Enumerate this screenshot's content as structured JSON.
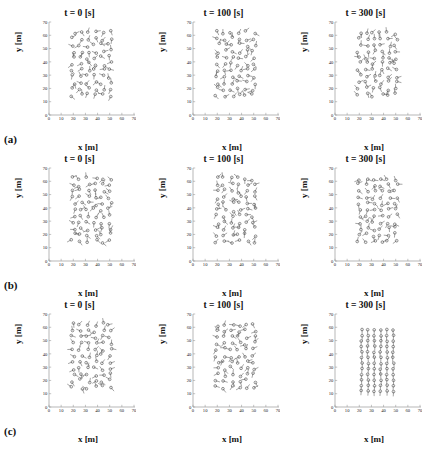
{
  "figure": {
    "type": "multi-panel-scatter-quiver",
    "rows": 3,
    "cols": 3,
    "background": "#ffffff",
    "marker_color": "#555555",
    "axis_color": "#888888"
  },
  "axis": {
    "xlabel": "x [m]",
    "ylabel": "y [m]",
    "xticks": [
      0,
      10,
      20,
      30,
      40,
      50,
      60,
      70
    ],
    "yticks": [
      0,
      10,
      20,
      30,
      40,
      50,
      60,
      70
    ],
    "xlim": [
      0,
      70
    ],
    "ylim": [
      0,
      70
    ],
    "grid": false
  },
  "row_labels": [
    "(a)",
    "(b)",
    "(c)"
  ],
  "column_titles": [
    "t = 0 [s]",
    "t = 100 [s]",
    "t = 300 [s]"
  ],
  "chart_data": {
    "type": "scatter",
    "title": "",
    "xlabel": "x [m]",
    "ylabel": "y [m]",
    "xlim": [
      0,
      70
    ],
    "ylim": [
      0,
      70
    ],
    "xticks": [
      0,
      10,
      20,
      30,
      40,
      50,
      60,
      70
    ],
    "yticks": [
      0,
      10,
      20,
      30,
      40,
      50,
      60,
      70
    ],
    "grid": false,
    "legend": "none",
    "marker": "open-circle-with-velocity-tail",
    "panels": [
      {
        "row": "(a)",
        "title": "t = 0 [s]",
        "n_points": 66,
        "cluster_x_range": [
          20,
          50
        ],
        "cluster_y_range": [
          15,
          62
        ],
        "order": "lattice-disordered-headings",
        "seed": 11
      },
      {
        "row": "(a)",
        "title": "t = 100 [s]",
        "n_points": 66,
        "cluster_x_range": [
          20,
          50
        ],
        "cluster_y_range": [
          15,
          62
        ],
        "order": "lattice-disordered-headings",
        "seed": 23
      },
      {
        "row": "(a)",
        "title": "t = 300 [s]",
        "n_points": 66,
        "cluster_x_range": [
          20,
          50
        ],
        "cluster_y_range": [
          15,
          62
        ],
        "order": "lattice-disordered-headings",
        "seed": 37
      },
      {
        "row": "(b)",
        "title": "t = 0 [s]",
        "n_points": 66,
        "cluster_x_range": [
          20,
          50
        ],
        "cluster_y_range": [
          15,
          62
        ],
        "order": "lattice-disordered-headings",
        "seed": 53
      },
      {
        "row": "(b)",
        "title": "t = 100 [s]",
        "n_points": 66,
        "cluster_x_range": [
          20,
          50
        ],
        "cluster_y_range": [
          15,
          62
        ],
        "order": "lattice-disordered-headings",
        "seed": 71
      },
      {
        "row": "(b)",
        "title": "t = 300 [s]",
        "n_points": 66,
        "cluster_x_range": [
          20,
          50
        ],
        "cluster_y_range": [
          15,
          62
        ],
        "order": "lattice-disordered-headings",
        "seed": 89
      },
      {
        "row": "(c)",
        "title": "t = 0 [s]",
        "n_points": 66,
        "cluster_x_range": [
          20,
          50
        ],
        "cluster_y_range": [
          15,
          62
        ],
        "order": "lattice-disordered-headings",
        "seed": 101
      },
      {
        "row": "(c)",
        "title": "t = 100 [s]",
        "n_points": 66,
        "cluster_x_range": [
          20,
          50
        ],
        "cluster_y_range": [
          15,
          62
        ],
        "order": "lattice-disordered-headings",
        "seed": 113
      },
      {
        "row": "(c)",
        "title": "t = 300 [s]",
        "n_points": 72,
        "cluster_x_range": [
          22,
          48
        ],
        "cluster_y_range": [
          12,
          58
        ],
        "order": "aligned-vertical-lanes",
        "lanes": 6,
        "per_lane": 12,
        "heading_deg": 270,
        "seed": 127
      }
    ]
  }
}
